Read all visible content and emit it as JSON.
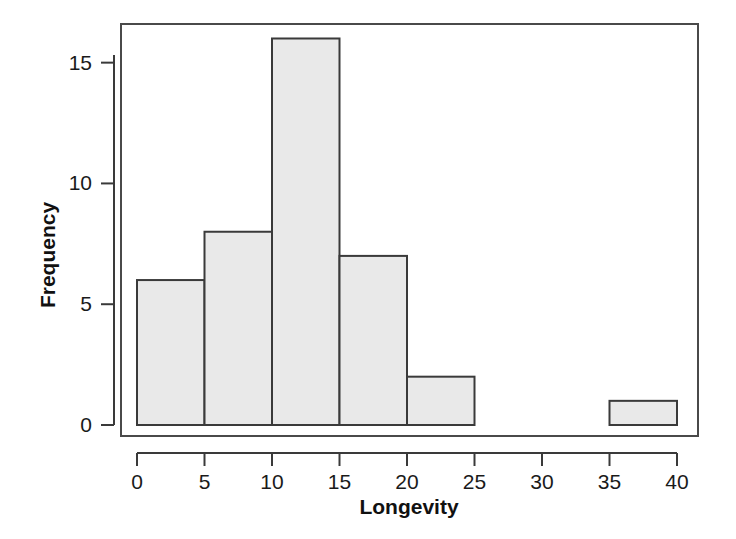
{
  "chart_data": {
    "type": "bar",
    "title": "",
    "xlabel": "Longevity",
    "ylabel": "Frequency",
    "bin_width": 5,
    "bin_edges": [
      0,
      5,
      10,
      15,
      20,
      25,
      30,
      35,
      40
    ],
    "categories": [
      "0-5",
      "5-10",
      "10-15",
      "15-20",
      "20-25",
      "25-30",
      "30-35",
      "35-40"
    ],
    "values": [
      6,
      8,
      16,
      7,
      2,
      0,
      0,
      1
    ],
    "xlim": [
      0,
      40
    ],
    "ylim": [
      0,
      16.6
    ],
    "xticks": [
      0,
      5,
      10,
      15,
      20,
      25,
      30,
      35,
      40
    ],
    "xtick_labels": [
      "0",
      "5",
      "10",
      "15",
      "20",
      "25",
      "30",
      "35",
      "40"
    ],
    "yticks": [
      0,
      5,
      10,
      15
    ],
    "ytick_labels": [
      "0",
      "5",
      "10",
      "15"
    ],
    "grid": false,
    "legend": false,
    "bar_fill_color": "#e9e9e9",
    "bar_edge_color": "#3a3a3a",
    "frame_color": "#4a4a4a",
    "background_color": "#ffffff"
  }
}
